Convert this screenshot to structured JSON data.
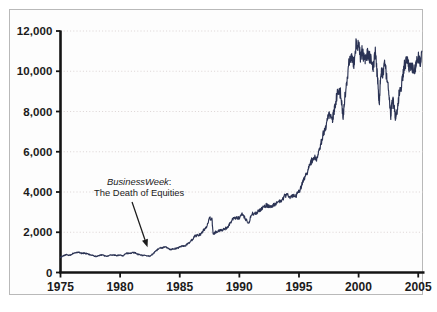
{
  "chart_data": {
    "type": "line",
    "title": "",
    "subtitle": "",
    "xlabel": "",
    "ylabel": "",
    "xlim": [
      1975,
      2005.4
    ],
    "ylim": [
      0,
      12000
    ],
    "xticks": [
      1975,
      1980,
      1985,
      1990,
      1995,
      2000,
      2005
    ],
    "xtick_labels": [
      "1975",
      "1980",
      "1985",
      "1990",
      "1995",
      "2000",
      "2005"
    ],
    "yticks": [
      0,
      2000,
      4000,
      6000,
      8000,
      10000,
      12000
    ],
    "ytick_labels": [
      "0",
      "2,000",
      "4,000",
      "6,000",
      "8,000",
      "10,000",
      "12,000"
    ],
    "grid": true,
    "grid_axis": "y",
    "grid_style": "dotted",
    "legend": false,
    "legend_position": "none",
    "line_color": "#2b3354",
    "grid_color": "#d8cfcf",
    "axis_color": "#141414",
    "series": [
      {
        "name": "Dow Jones Industrial Average",
        "x": [
          1975.0,
          1975.25,
          1975.5,
          1975.75,
          1976.0,
          1976.25,
          1976.5,
          1976.75,
          1977.0,
          1977.25,
          1977.5,
          1977.75,
          1978.0,
          1978.25,
          1978.5,
          1978.75,
          1979.0,
          1979.25,
          1979.5,
          1979.75,
          1980.0,
          1980.25,
          1980.5,
          1980.75,
          1981.0,
          1981.25,
          1981.5,
          1981.75,
          1982.0,
          1982.25,
          1982.5,
          1982.75,
          1983.0,
          1983.25,
          1983.5,
          1983.75,
          1984.0,
          1984.25,
          1984.5,
          1984.75,
          1985.0,
          1985.25,
          1985.5,
          1985.75,
          1986.0,
          1986.25,
          1986.5,
          1986.75,
          1987.0,
          1987.25,
          1987.5,
          1987.7,
          1987.8,
          1987.9,
          1988.0,
          1988.25,
          1988.5,
          1988.75,
          1989.0,
          1989.25,
          1989.5,
          1989.75,
          1990.0,
          1990.25,
          1990.5,
          1990.8,
          1991.0,
          1991.25,
          1991.5,
          1991.75,
          1992.0,
          1992.25,
          1992.5,
          1992.75,
          1993.0,
          1993.25,
          1993.5,
          1993.75,
          1994.0,
          1994.25,
          1994.5,
          1994.75,
          1995.0,
          1995.25,
          1995.5,
          1995.75,
          1996.0,
          1996.25,
          1996.5,
          1996.75,
          1997.0,
          1997.25,
          1997.5,
          1997.8,
          1997.9,
          1998.0,
          1998.25,
          1998.5,
          1998.7,
          1998.85,
          1999.0,
          1999.2,
          1999.4,
          1999.6,
          1999.8,
          2000.0,
          2000.15,
          2000.3,
          2000.45,
          2000.6,
          2000.75,
          2000.9,
          2001.0,
          2001.2,
          2001.4,
          2001.6,
          2001.73,
          2001.85,
          2002.0,
          2002.2,
          2002.4,
          2002.55,
          2002.7,
          2002.78,
          2002.9,
          2003.0,
          2003.1,
          2003.25,
          2003.4,
          2003.6,
          2003.8,
          2004.0,
          2004.15,
          2004.3,
          2004.5,
          2004.7,
          2004.85,
          2005.0,
          2005.15,
          2005.3
        ],
        "values": [
          760,
          840,
          880,
          850,
          930,
          990,
          1000,
          960,
          960,
          930,
          880,
          830,
          790,
          850,
          880,
          810,
          830,
          860,
          870,
          840,
          880,
          830,
          950,
          960,
          975,
          990,
          900,
          860,
          850,
          830,
          800,
          930,
          1070,
          1190,
          1230,
          1260,
          1230,
          1130,
          1180,
          1190,
          1270,
          1310,
          1340,
          1460,
          1600,
          1800,
          1840,
          1900,
          2100,
          2300,
          2700,
          2640,
          1950,
          1940,
          2000,
          2070,
          2110,
          2150,
          2250,
          2450,
          2700,
          2720,
          2700,
          2900,
          2680,
          2450,
          2900,
          2940,
          3000,
          3080,
          3230,
          3350,
          3300,
          3280,
          3400,
          3510,
          3580,
          3750,
          3900,
          3700,
          3780,
          3830,
          4000,
          4400,
          4700,
          5100,
          5500,
          5650,
          5700,
          6200,
          6800,
          7200,
          7900,
          7600,
          7900,
          8200,
          9000,
          8900,
          7700,
          8700,
          9400,
          10500,
          10800,
          10400,
          11400,
          11300,
          10700,
          11000,
          10700,
          10600,
          10900,
          10700,
          10600,
          10200,
          10900,
          9600,
          8300,
          9900,
          9900,
          10400,
          9500,
          8900,
          7700,
          8300,
          8500,
          8100,
          7700,
          8100,
          8900,
          9300,
          10200,
          10500,
          10400,
          10100,
          10200,
          10000,
          10400,
          10700,
          10400,
          11000
        ]
      }
    ],
    "annotations": [
      {
        "name": "businessweek-death-of-equities",
        "line1_italic": "BusinessWeek",
        "line1_suffix": ":",
        "line2": "The Death of Equities",
        "text_x": 1981.6,
        "text_y": 4350,
        "arrow_from_x": 1981.0,
        "arrow_from_y": 3500,
        "arrow_to_x": 1982.3,
        "arrow_to_y": 1250
      }
    ]
  }
}
